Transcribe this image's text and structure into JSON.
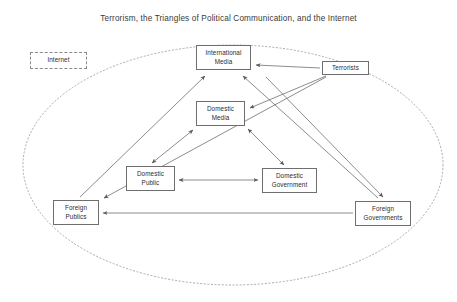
{
  "diagram": {
    "title": "Terrorism, the Triangles of Political Communication, and the Internet",
    "type": "node-link-diagram",
    "boundary": {
      "shape": "ellipse",
      "style": "dotted",
      "name": "internet-boundary-ellipse"
    },
    "nodes": [
      {
        "id": "internet",
        "label": "Internet",
        "x": 30,
        "y": 52,
        "w": 57,
        "h": 17,
        "border": "dashed"
      },
      {
        "id": "international-media",
        "label": "International\nMedia",
        "x": 196,
        "y": 45,
        "w": 55,
        "h": 25,
        "border": "solid"
      },
      {
        "id": "terrorists",
        "label": "Terrorists",
        "x": 322,
        "y": 61,
        "w": 47,
        "h": 14,
        "border": "solid"
      },
      {
        "id": "domestic-media",
        "label": "Domestic\nMedia",
        "x": 196,
        "y": 101,
        "w": 49,
        "h": 25,
        "border": "solid"
      },
      {
        "id": "domestic-public",
        "label": "Domestic\nPublic",
        "x": 126,
        "y": 166,
        "w": 49,
        "h": 25,
        "border": "solid"
      },
      {
        "id": "domestic-government",
        "label": "Domestic\nGovernment",
        "x": 262,
        "y": 168,
        "w": 55,
        "h": 25,
        "border": "solid"
      },
      {
        "id": "foreign-publics",
        "label": "Foreign\nPublics",
        "x": 53,
        "y": 200,
        "w": 46,
        "h": 25,
        "border": "solid"
      },
      {
        "id": "foreign-governments",
        "label": "Foreign\nGovernments",
        "x": 355,
        "y": 201,
        "w": 56,
        "h": 25,
        "border": "solid"
      }
    ],
    "edges": [
      {
        "from": "terrorists",
        "to": "international-media",
        "arrows": "single"
      },
      {
        "from": "terrorists",
        "to": "domestic-media",
        "arrows": "single"
      },
      {
        "from": "terrorists",
        "to": "foreign-publics",
        "arrows": "single"
      },
      {
        "from": "terrorists",
        "to": "foreign-governments",
        "arrows": "single"
      },
      {
        "from": "domestic-media",
        "to": "domestic-public",
        "arrows": "double"
      },
      {
        "from": "domestic-media",
        "to": "domestic-government",
        "arrows": "double"
      },
      {
        "from": "domestic-public",
        "to": "domestic-government",
        "arrows": "double"
      },
      {
        "from": "foreign-publics",
        "to": "international-media",
        "arrows": "single"
      },
      {
        "from": "foreign-governments",
        "to": "international-media",
        "arrows": "single"
      },
      {
        "from": "foreign-governments",
        "to": "foreign-publics",
        "arrows": "single"
      }
    ]
  },
  "colors": {
    "stroke": "#6e6e6e",
    "boundary": "#9a9a9a",
    "text": "#2b2b2b",
    "title": "#3a3a3a",
    "background": "#ffffff"
  }
}
